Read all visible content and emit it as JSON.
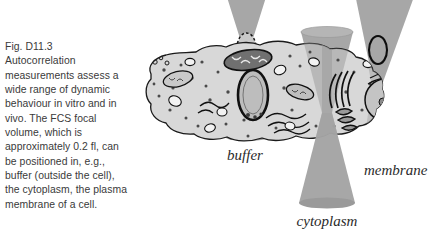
{
  "figure": {
    "caption_id": "Fig. D11.3",
    "caption_lines": [
      "Autocorrelation",
      "measurements assess a",
      "wide range of dynamic",
      "behaviour in vitro and in",
      "vivo. The FCS focal",
      "volume, which is",
      "approximately 0.2 fl, can",
      "be positioned in, e.g.,",
      "buffer (outside the cell),",
      "the cytoplasm, the plasma",
      "membrane of a cell."
    ],
    "caption_full": "Fig. D11.3 Autocorrelation measurements assess a wide range of dynamic behaviour in vitro and in vivo. The FCS focal volume, which is approximately 0.2 fl, can be positioned in, e.g., buffer (outside the cell), the cytoplasm, the plasma membrane of a cell.",
    "labels": {
      "buffer": "buffer",
      "cytoplasm": "cytoplasm",
      "membrane": "membrane"
    },
    "colors": {
      "background": "#ffffff",
      "cone_gray": "#a3a3a3",
      "cone_gray_dark": "#8e8e8e",
      "cytosol": "#d8d8d8",
      "organelle_mid": "#b9b9b9",
      "organelle_dark": "#6f6f6f",
      "outline": "#1a1a1a",
      "text": "#3a3a3a",
      "label_text": "#2b2b2b",
      "focal_fill": "#c6c6c6"
    },
    "elements": {
      "buffer_focal_volume": "dashed-ellipse-focal-volume",
      "cytoplasm_focal_volume": "cone-waist-in-cytosol",
      "membrane_focal_volume": "ellipse-on-plasma-membrane",
      "cell": "eukaryotic-cell-cross-section",
      "organelles": [
        "nucleus",
        "mitochondria",
        "golgi-apparatus",
        "endoplasmic-reticulum",
        "vesicles",
        "ribosome-dots"
      ]
    }
  }
}
